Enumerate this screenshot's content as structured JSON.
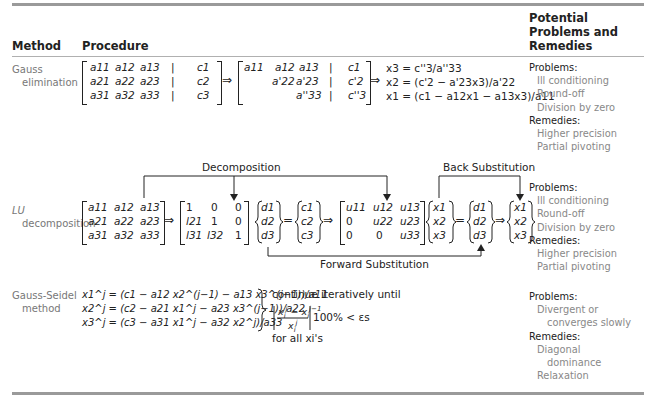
{
  "table": {
    "headers": {
      "method": "Method",
      "procedure": "Procedure",
      "problems": "Potential Problems and Remedies",
      "problems_lines": [
        "Potential",
        "Problems and",
        "Remedies"
      ]
    },
    "rows": [
      {
        "method_lines": [
          "Gauss",
          "elimination"
        ],
        "procedure": {
          "augmented_matrix": [
            [
              "a11",
              "a12",
              "a13",
              "|",
              "c1"
            ],
            [
              "a21",
              "a22",
              "a23",
              "|",
              "c2"
            ],
            [
              "a31",
              "a32",
              "a33",
              "|",
              "c3"
            ]
          ],
          "arrow": "⇒",
          "upper_matrix": [
            [
              "a11",
              "a12",
              "a13",
              "|",
              "c1"
            ],
            [
              "",
              "a'22",
              "a'23",
              "|",
              "c'2"
            ],
            [
              "",
              "",
              "a''33",
              "|",
              "c''3"
            ]
          ],
          "back_substitution": [
            "x3 = c''3/a''33",
            "x2 = (c'2 − a'23x3)/a'22",
            "x1 = (c1 − a12x1 − a13x3)/a11"
          ]
        },
        "problems_label": "Problems:",
        "problems": [
          "Ill conditioning",
          "Round-off",
          "Division by zero"
        ],
        "remedies_label": "Remedies:",
        "remedies": [
          "Higher precision",
          "Partial pivoting"
        ]
      },
      {
        "method_lines": [
          "LU",
          "decomposition"
        ],
        "procedure": {
          "decomposition_label": "Decomposition",
          "back_substitution_label": "Back Substitution",
          "forward_substitution_label": "Forward Substitution",
          "A_matrix": [
            [
              "a11",
              "a12",
              "a13"
            ],
            [
              "a21",
              "a22",
              "a23"
            ],
            [
              "a31",
              "a32",
              "a33"
            ]
          ],
          "L_matrix": [
            [
              "1",
              "0",
              "0"
            ],
            [
              "l21",
              "1",
              "0"
            ],
            [
              "l31",
              "l32",
              "1"
            ]
          ],
          "d_vector": [
            "d1",
            "d2",
            "d3"
          ],
          "c_vector": [
            "c1",
            "c2",
            "c3"
          ],
          "U_matrix": [
            [
              "u11",
              "u12",
              "u13"
            ],
            [
              "0",
              "u22",
              "u23"
            ],
            [
              "0",
              "0",
              "u33"
            ]
          ],
          "x_vector": [
            "x1",
            "x2",
            "x3"
          ],
          "d_vector2": [
            "d1",
            "d2",
            "d3"
          ],
          "x_result": [
            "x1",
            "x2",
            "x3"
          ],
          "arrow": "⇒",
          "equals": "="
        },
        "problems_label": "Problems:",
        "problems": [
          "Ill conditioning",
          "Round-off",
          "Division by zero"
        ],
        "remedies_label": "Remedies:",
        "remedies": [
          "Higher precision",
          "Partial pivoting"
        ]
      },
      {
        "method_lines": [
          "Gauss-Seidel",
          "method"
        ],
        "procedure": {
          "equations": [
            "x1^j = (c1 − a12 x2^(j−1) − a13 x3^(j−1))/a11",
            "x2^j = (c2 − a21 x1^j − a23 x3^(j−1))/a22",
            "x3^j = (c3 − a31 x1^j − a32 x2^j)/a33"
          ],
          "condition_intro": "continue iteratively until",
          "condition": "|(xi^j − xi^(j−1)) / xi^j| 100% < εs",
          "condition_tail": "100% < εs",
          "for_all": "for all xi's"
        },
        "problems_label": "Problems:",
        "problems": [
          "Divergent or",
          "converges slowly"
        ],
        "remedies_label": "Remedies:",
        "remedies": [
          "Diagonal",
          "dominance",
          "Relaxation"
        ]
      }
    ]
  }
}
